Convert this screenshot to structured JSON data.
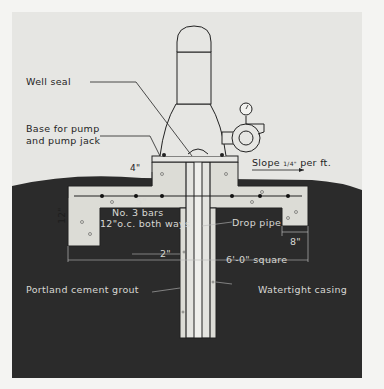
{
  "diagram": {
    "colors": {
      "background": "#e6e6e3",
      "soil": "#2b2b2b",
      "concrete": "#dcdcd6",
      "lines": "#222222",
      "dark_label": "#1e1e1e",
      "light_label": "#d8d8d4"
    },
    "labels": {
      "well_seal": "Well seal",
      "base_line1": "Base for pump",
      "base_line2": "and pump jack",
      "dim_4in": "4\"",
      "slope": "Slope",
      "slope_fraction": "1/4\"",
      "slope_unit": "per  ft.",
      "dim_12in": "12\"",
      "dim_5in": "5\"",
      "bars_line1": "No. 3 bars",
      "bars_line2": "12\"o.c. both ways",
      "dim_2in": "2\"",
      "drop_pipe": "Drop pipe",
      "dim_8in": "8\"",
      "square": "6'-0\" square",
      "grout": "Portland cement grout",
      "casing": "Watertight casing"
    },
    "components": [
      "pump-motor",
      "pump-head",
      "pressure-gauge",
      "pump-jack",
      "concrete-slab",
      "casing",
      "drop-pipe",
      "grout-column",
      "rebar"
    ]
  }
}
